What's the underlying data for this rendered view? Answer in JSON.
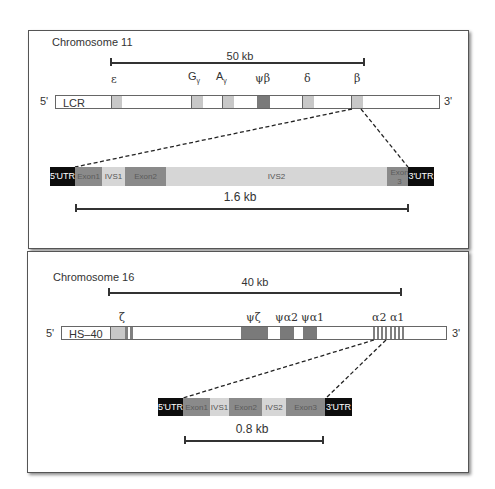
{
  "panels": [
    {
      "title": "Chromosome 11",
      "scale_label": "50 kb",
      "five_prime": "5'",
      "three_prime": "3'",
      "control_region": "LCR",
      "genes": [
        {
          "label": "ε",
          "sub": ""
        },
        {
          "label": "G",
          "sub": "γ"
        },
        {
          "label": "A",
          "sub": "γ"
        },
        {
          "label": "ψβ",
          "sub": ""
        },
        {
          "label": "δ",
          "sub": ""
        },
        {
          "label": "β",
          "sub": ""
        }
      ],
      "detail": {
        "segments": [
          "5'UTR",
          "Exon1",
          "IVS1",
          "Exon2",
          "IVS2",
          "Exon 3",
          "3'UTR"
        ],
        "scale_label": "1.6 kb"
      }
    },
    {
      "title": "Chromosome 16",
      "scale_label": "40 kb",
      "five_prime": "5'",
      "three_prime": "3'",
      "control_region": "HS–40",
      "genes": [
        {
          "label": "ζ",
          "sub": ""
        },
        {
          "label": "ψζ",
          "sub": ""
        },
        {
          "label": "ψα2",
          "sub": ""
        },
        {
          "label": "ψα1",
          "sub": ""
        },
        {
          "label": "α2 α1",
          "sub": ""
        }
      ],
      "detail": {
        "segments": [
          "5'UTR",
          "Exon1",
          "IVS1",
          "Exon2",
          "IVS2",
          "Exon3",
          "3'UTR"
        ],
        "scale_label": "0.8 kb"
      }
    }
  ],
  "colors": {
    "utr": "#0d0d0d",
    "exon": "#8a8a8a",
    "intron": "#d6d6d6",
    "gene_light": "#c8c8c8",
    "pseudogene_dark": "#7a7a7a"
  }
}
